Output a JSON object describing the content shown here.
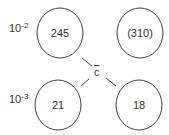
{
  "diagram": {
    "row_labels": [
      {
        "base": "10",
        "exponent": "-2"
      },
      {
        "base": "10",
        "exponent": "-3"
      }
    ],
    "center_label": "c",
    "circles": [
      {
        "position": "top-left",
        "value": "245"
      },
      {
        "position": "top-right",
        "value": "(310)"
      },
      {
        "position": "bottom-left",
        "value": "21"
      },
      {
        "position": "bottom-right",
        "value": "18"
      }
    ],
    "colors": {
      "stroke": "#444444",
      "text": "#333333",
      "background": "#ffffff"
    }
  }
}
